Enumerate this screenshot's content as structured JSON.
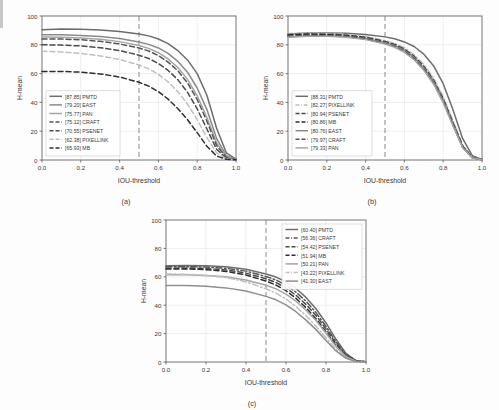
{
  "figure": {
    "axis_x_label": "IOU-threshold",
    "axis_y_label": "H-mean",
    "x_ticks": [
      "0.0",
      "0.2",
      "0.4",
      "0.6",
      "0.8",
      "1.0"
    ],
    "y_ticks": [
      "0",
      "20",
      "40",
      "60",
      "80",
      "100"
    ],
    "reference_line_x": 0.5
  },
  "chart_data": [
    {
      "type": "line",
      "panel": "a",
      "caption": "(a)",
      "title": "",
      "xlabel": "IOU-threshold",
      "ylabel": "H-mean",
      "xlim": [
        0.0,
        1.0
      ],
      "ylim": [
        0,
        100
      ],
      "grid": true,
      "legend_position": "lower-left",
      "annotations": [
        {
          "type": "vline",
          "x": 0.5,
          "style": "dashed"
        }
      ],
      "x": [
        0.0,
        0.1,
        0.2,
        0.3,
        0.4,
        0.5,
        0.55,
        0.6,
        0.65,
        0.7,
        0.75,
        0.8,
        0.85,
        0.9,
        0.95,
        1.0
      ],
      "series": [
        {
          "name": "PMTD",
          "score": "87.85",
          "label": "[87.85] PMTD",
          "color": "#6d6d6d",
          "dash": "solid",
          "values": [
            90.5,
            91.0,
            90.8,
            90.2,
            89.3,
            87.5,
            86.2,
            84.0,
            80.8,
            76.0,
            69.5,
            60.0,
            45.0,
            22.0,
            5.0,
            0.6
          ]
        },
        {
          "name": "EAST",
          "score": "79.20",
          "label": "[79.20] EAST",
          "color": "#8a8a8a",
          "dash": "solid",
          "values": [
            87.0,
            87.0,
            86.5,
            85.7,
            84.3,
            82.0,
            80.3,
            77.8,
            74.0,
            68.5,
            61.0,
            50.0,
            35.0,
            15.0,
            3.0,
            0.4
          ]
        },
        {
          "name": "PAN",
          "score": "75.77",
          "label": "[75.77] PAN",
          "color": "#a5a5a5",
          "dash": "solid",
          "values": [
            85.5,
            85.3,
            84.8,
            83.8,
            82.2,
            79.5,
            77.5,
            74.5,
            70.2,
            64.2,
            56.0,
            44.5,
            29.5,
            12.0,
            2.2,
            0.3
          ]
        },
        {
          "name": "CRAFT",
          "score": "75.12",
          "label": "[75.12] CRAFT",
          "color": "#555555",
          "dash": "dashed",
          "values": [
            84.0,
            84.0,
            83.5,
            82.4,
            80.6,
            77.8,
            75.7,
            72.5,
            68.0,
            62.0,
            53.5,
            42.0,
            27.0,
            10.0,
            1.8,
            0.3
          ]
        },
        {
          "name": "PSENET",
          "score": "70.55",
          "label": "[70.55] PSENET",
          "color": "#4a4a4a",
          "dash": "dashed",
          "values": [
            80.0,
            79.8,
            79.2,
            78.0,
            76.0,
            72.8,
            70.5,
            67.0,
            62.2,
            55.8,
            47.0,
            35.5,
            21.5,
            7.5,
            1.2,
            0.2
          ]
        },
        {
          "name": "PIXELLINK",
          "score": "62.38",
          "label": "[62.38] PIXELLINK",
          "color": "#bfbfbf",
          "dash": "dashed",
          "values": [
            75.5,
            75.0,
            74.0,
            72.3,
            69.8,
            66.0,
            63.3,
            59.5,
            54.3,
            47.5,
            38.8,
            28.0,
            15.5,
            5.0,
            0.8,
            0.2
          ]
        },
        {
          "name": "MB",
          "score": "65.93",
          "label": "[65.93] MB",
          "color": "#2e2e2e",
          "dash": "dashed",
          "values": [
            61.5,
            61.5,
            61.0,
            59.8,
            57.6,
            54.0,
            51.3,
            47.5,
            42.3,
            35.8,
            28.0,
            19.0,
            9.5,
            2.8,
            0.5,
            0.1
          ]
        }
      ]
    },
    {
      "type": "line",
      "panel": "b",
      "caption": "(b)",
      "title": "",
      "xlabel": "IOU-threshold",
      "ylabel": "H-mean",
      "xlim": [
        0.0,
        1.0
      ],
      "ylim": [
        0,
        100
      ],
      "grid": true,
      "legend_position": "lower-left",
      "annotations": [
        {
          "type": "vline",
          "x": 0.5,
          "style": "dashed"
        }
      ],
      "x": [
        0.0,
        0.1,
        0.2,
        0.3,
        0.4,
        0.5,
        0.55,
        0.6,
        0.65,
        0.7,
        0.75,
        0.8,
        0.85,
        0.9,
        0.95,
        1.0
      ],
      "series": [
        {
          "name": "PMTD",
          "score": "88.31",
          "label": "[88.31] PMTD",
          "color": "#6d6d6d",
          "dash": "solid",
          "values": [
            87.5,
            88.2,
            88.2,
            88.0,
            87.2,
            85.5,
            84.2,
            82.0,
            78.8,
            73.5,
            65.5,
            53.0,
            35.0,
            15.0,
            3.0,
            0.4
          ]
        },
        {
          "name": "PIXELLINK",
          "score": "82.27",
          "label": "[82.27] PIXELLINK",
          "color": "#bdbdbd",
          "dash": "dashdot",
          "values": [
            87.8,
            88.0,
            87.8,
            87.2,
            85.8,
            83.0,
            81.0,
            78.0,
            73.2,
            66.5,
            57.0,
            44.0,
            27.5,
            10.5,
            2.0,
            0.3
          ]
        },
        {
          "name": "PSENET",
          "score": "80.94",
          "label": "[80.94] PSENET",
          "color": "#4a4a4a",
          "dash": "dashed",
          "values": [
            87.2,
            87.5,
            87.3,
            86.7,
            85.2,
            82.3,
            80.2,
            77.0,
            72.0,
            65.0,
            55.5,
            42.5,
            26.0,
            9.8,
            1.8,
            0.3
          ]
        },
        {
          "name": "MB",
          "score": "80.86",
          "label": "[80.86] MB",
          "color": "#2e2e2e",
          "dash": "dashed",
          "values": [
            86.8,
            87.2,
            87.0,
            86.4,
            84.9,
            82.0,
            79.9,
            76.6,
            71.6,
            64.5,
            55.0,
            42.0,
            25.6,
            9.5,
            1.7,
            0.3
          ]
        },
        {
          "name": "EAST",
          "score": "80.76",
          "label": "[80.76] EAST",
          "color": "#8a8a8a",
          "dash": "solid",
          "values": [
            85.5,
            86.3,
            86.3,
            85.8,
            84.4,
            81.6,
            79.5,
            76.2,
            71.2,
            64.0,
            54.5,
            41.5,
            25.2,
            9.2,
            1.6,
            0.3
          ]
        },
        {
          "name": "CRAFT",
          "score": "79.97",
          "label": "[79.97] CRAFT",
          "color": "#555555",
          "dash": "dashed",
          "values": [
            86.0,
            86.5,
            86.3,
            85.6,
            84.0,
            81.0,
            78.8,
            75.4,
            70.3,
            63.0,
            53.5,
            40.5,
            24.4,
            8.8,
            1.5,
            0.2
          ]
        },
        {
          "name": "PAN",
          "score": "79.33",
          "label": "[79.33] PAN",
          "color": "#a5a5a5",
          "dash": "solid",
          "values": [
            85.2,
            86.0,
            85.9,
            85.2,
            83.6,
            80.5,
            78.3,
            74.8,
            69.6,
            62.3,
            52.8,
            39.8,
            23.8,
            8.5,
            1.4,
            0.2
          ]
        }
      ]
    },
    {
      "type": "line",
      "panel": "c",
      "caption": "(c)",
      "title": "",
      "xlabel": "IOU-threshold",
      "ylabel": "H-mean",
      "xlim": [
        0.0,
        1.0
      ],
      "ylim": [
        0,
        100
      ],
      "grid": true,
      "legend_position": "upper-right",
      "annotations": [
        {
          "type": "vline",
          "x": 0.5,
          "style": "dashed"
        }
      ],
      "x": [
        0.0,
        0.1,
        0.2,
        0.3,
        0.4,
        0.5,
        0.55,
        0.6,
        0.65,
        0.7,
        0.75,
        0.8,
        0.85,
        0.9,
        0.95,
        1.0
      ],
      "series": [
        {
          "name": "PMTD",
          "score": "60.40",
          "label": "[60.40] PMTD",
          "color": "#6d6d6d",
          "dash": "solid",
          "values": [
            67.8,
            68.0,
            67.8,
            67.0,
            65.3,
            62.0,
            59.8,
            56.5,
            51.8,
            45.5,
            37.5,
            27.5,
            16.0,
            6.0,
            1.0,
            0.2
          ]
        },
        {
          "name": "CRAFT",
          "score": "56.36",
          "label": "[56.36] CRAFT",
          "color": "#555555",
          "dash": "dashdot",
          "values": [
            67.0,
            67.2,
            66.9,
            66.0,
            64.0,
            60.2,
            57.8,
            54.2,
            49.2,
            42.8,
            34.8,
            25.0,
            14.2,
            5.2,
            0.9,
            0.2
          ]
        },
        {
          "name": "PSENET",
          "score": "54.42",
          "label": "[54.42] PSENET",
          "color": "#4a4a4a",
          "dash": "dashed",
          "values": [
            66.0,
            66.2,
            65.8,
            64.8,
            62.6,
            58.6,
            56.0,
            52.2,
            47.0,
            40.5,
            32.8,
            23.2,
            13.0,
            4.6,
            0.8,
            0.1
          ]
        },
        {
          "name": "MB",
          "score": "51.94",
          "label": "[51.94] MB",
          "color": "#2e2e2e",
          "dash": "dashed",
          "values": [
            65.5,
            65.6,
            65.0,
            63.8,
            61.3,
            57.0,
            54.2,
            50.2,
            44.8,
            38.2,
            30.5,
            21.2,
            11.6,
            4.0,
            0.7,
            0.1
          ]
        },
        {
          "name": "PAN",
          "score": "50.21",
          "label": "[50.21] PAN",
          "color": "#a5a5a5",
          "dash": "solid",
          "values": [
            61.5,
            61.5,
            61.0,
            60.0,
            57.8,
            54.0,
            51.5,
            47.8,
            42.8,
            36.5,
            29.2,
            20.2,
            11.0,
            3.8,
            0.6,
            0.1
          ]
        },
        {
          "name": "PIXELLINK",
          "score": "43.22",
          "label": "[43.22] PIXELLINK",
          "color": "#bfbfbf",
          "dash": "dashdot",
          "values": [
            62.0,
            61.8,
            61.0,
            59.5,
            56.5,
            51.5,
            48.5,
            44.4,
            39.0,
            32.5,
            25.2,
            17.0,
            9.0,
            3.0,
            0.5,
            0.1
          ]
        },
        {
          "name": "EAST",
          "score": "41.30",
          "label": "[41.30] EAST",
          "color": "#8f8f8f",
          "dash": "solid",
          "values": [
            53.8,
            53.8,
            53.3,
            52.2,
            50.0,
            46.2,
            43.8,
            40.2,
            35.4,
            29.5,
            22.8,
            15.2,
            7.8,
            2.6,
            0.4,
            0.1
          ]
        }
      ]
    }
  ]
}
